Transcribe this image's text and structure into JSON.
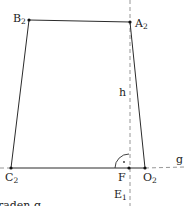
{
  "diagram": {
    "type": "geometric-construction",
    "colors": {
      "line": "#2b2b2b",
      "dashed": "#8a8a8a",
      "text": "#222222"
    },
    "points": {
      "B2": {
        "label": "B",
        "sub": "2"
      },
      "A2": {
        "label": "A",
        "sub": "2"
      },
      "C2": {
        "label": "C",
        "sub": "2"
      },
      "O2": {
        "label": "O",
        "sub": "2"
      },
      "F": {
        "label": "F"
      },
      "E1": {
        "label": "E",
        "sub": "1"
      }
    },
    "labels": {
      "height": "h",
      "line_g": "g",
      "right_angle_mark": "·"
    },
    "caption_fragment": "raden  g"
  }
}
